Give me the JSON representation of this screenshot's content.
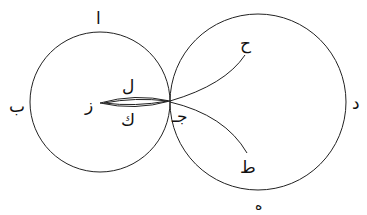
{
  "diagram": {
    "type": "geometric figure",
    "stroke_color": "#222222",
    "background": "#ffffff",
    "circles": [
      {
        "name": "left-circle",
        "cx": 100,
        "cy": 102,
        "r": 70
      },
      {
        "name": "right-circle",
        "cx": 258,
        "cy": 102,
        "r": 88
      }
    ],
    "labels": {
      "alif": "ا",
      "ba": "ب",
      "jim": "جـ",
      "dal": "د",
      "ha": "ه",
      "zay": "ز",
      "ha_hutti": "ح",
      "ta": "ط",
      "kaf": "ك",
      "lam": "ل"
    }
  }
}
